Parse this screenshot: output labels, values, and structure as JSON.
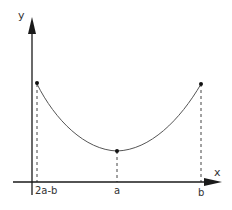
{
  "diagram": {
    "type": "function-graph",
    "axes": {
      "x_label": "x",
      "y_label": "y"
    },
    "tick_labels": {
      "left": "2a-b",
      "middle": "a",
      "right": "b"
    },
    "points": [
      {
        "name": "left-endpoint",
        "x_label": "2a-b"
      },
      {
        "name": "minimum",
        "x_label": "a"
      },
      {
        "name": "right-endpoint",
        "x_label": "b"
      }
    ],
    "colors": {
      "axis": "#1a1a1a",
      "curve": "#555555",
      "dashed": "#444444",
      "point": "#111111"
    }
  }
}
